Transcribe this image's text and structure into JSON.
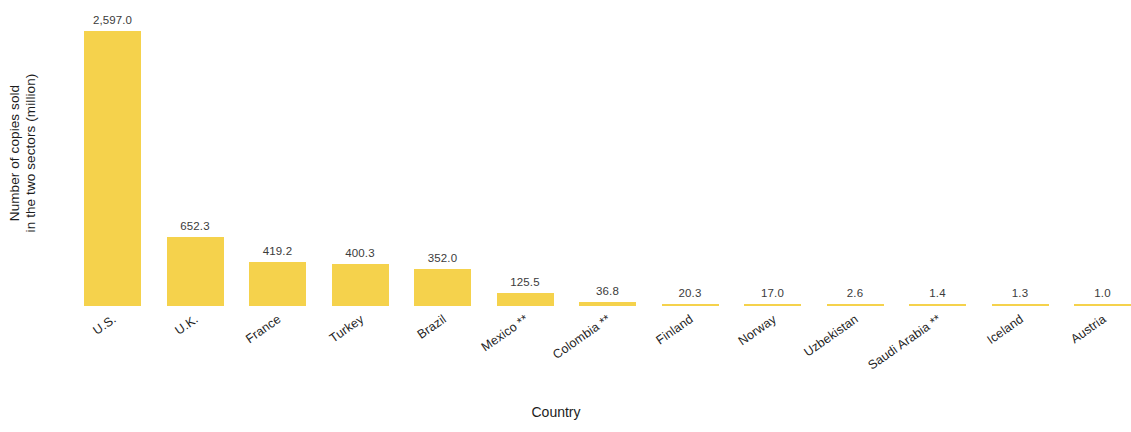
{
  "chart_data": {
    "type": "bar",
    "title": "",
    "xlabel": "Country",
    "ylabel": "Number of copies sold in the two sectors (million)",
    "ylabel_lines": [
      "Number of copies sold",
      "in the two sectors (million)"
    ],
    "categories": [
      "U.S.",
      "U.K.",
      "France",
      "Turkey",
      "Brazil",
      "Mexico **",
      "Colombia **",
      "Finland",
      "Norway",
      "Uzbekistan",
      "Saudi Arabia **",
      "Iceland",
      "Austria"
    ],
    "values": [
      2597.0,
      652.3,
      419.2,
      400.3,
      352.0,
      125.5,
      36.8,
      20.3,
      17.0,
      2.6,
      1.4,
      1.3,
      1.0
    ],
    "value_labels": [
      "2,597.0",
      "652.3",
      "419.2",
      "400.3",
      "352.0",
      "125.5",
      "36.8",
      "20.3",
      "17.0",
      "2.6",
      "1.4",
      "1.3",
      "1.0"
    ],
    "ylim": [
      0,
      2597.0
    ],
    "grid": false,
    "axis_lines": false,
    "legend": "none",
    "bar_color": "#f5d24c",
    "value_label_color": "#3b3b3b",
    "tick_label_color": "#1f1f1f",
    "background_color": "#ffffff",
    "tick_label_rotation_deg": -35
  },
  "axis": {
    "x_title": "Country",
    "y_title_line1": "Number of copies sold",
    "y_title_line2": "in the two sectors (million)"
  }
}
